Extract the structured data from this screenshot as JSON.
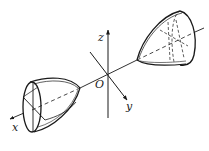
{
  "figure": {
    "labels": {
      "z": "z",
      "y": "y",
      "x": "x",
      "origin": "O"
    }
  },
  "colors": {
    "stroke": "#1a1a1a",
    "background": "#ffffff"
  }
}
